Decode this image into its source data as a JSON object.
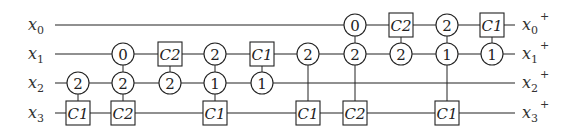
{
  "diagram": {
    "type": "reversible-circuit",
    "wires": [
      {
        "id": "x0",
        "input_label": "x",
        "input_sub": "0",
        "output_label": "x",
        "output_sub": "0",
        "output_sup": "+"
      },
      {
        "id": "x1",
        "input_label": "x",
        "input_sub": "1",
        "output_label": "x",
        "output_sub": "1",
        "output_sup": "+"
      },
      {
        "id": "x2",
        "input_label": "x",
        "input_sub": "2",
        "output_label": "x",
        "output_sub": "2",
        "output_sup": "+"
      },
      {
        "id": "x3",
        "input_label": "x",
        "input_sub": "3",
        "output_label": "x",
        "output_sub": "3",
        "output_sup": "+"
      }
    ],
    "columns": [
      {
        "gates": [
          {
            "wire": 2,
            "kind": "circle",
            "text": "2"
          },
          {
            "wire": 3,
            "kind": "box",
            "text": "C1"
          }
        ]
      },
      {
        "gates": [
          {
            "wire": 1,
            "kind": "circle",
            "text": "0"
          },
          {
            "wire": 2,
            "kind": "circle",
            "text": "2"
          },
          {
            "wire": 3,
            "kind": "box",
            "text": "C2"
          }
        ]
      },
      {
        "gates": [
          {
            "wire": 1,
            "kind": "box",
            "text": "C2"
          },
          {
            "wire": 2,
            "kind": "circle",
            "text": "2"
          }
        ]
      },
      {
        "gates": [
          {
            "wire": 1,
            "kind": "circle",
            "text": "2"
          },
          {
            "wire": 2,
            "kind": "circle",
            "text": "1"
          },
          {
            "wire": 3,
            "kind": "box",
            "text": "C1"
          }
        ]
      },
      {
        "gates": [
          {
            "wire": 1,
            "kind": "box",
            "text": "C1"
          },
          {
            "wire": 2,
            "kind": "circle",
            "text": "1"
          }
        ]
      },
      {
        "gates": [
          {
            "wire": 1,
            "kind": "circle",
            "text": "2"
          },
          {
            "wire": 3,
            "kind": "box",
            "text": "C1"
          }
        ]
      },
      {
        "gates": [
          {
            "wire": 0,
            "kind": "circle",
            "text": "0"
          },
          {
            "wire": 1,
            "kind": "circle",
            "text": "2"
          },
          {
            "wire": 3,
            "kind": "box",
            "text": "C2"
          }
        ]
      },
      {
        "gates": [
          {
            "wire": 0,
            "kind": "box",
            "text": "C2"
          },
          {
            "wire": 1,
            "kind": "circle",
            "text": "2"
          }
        ]
      },
      {
        "gates": [
          {
            "wire": 0,
            "kind": "circle",
            "text": "2"
          },
          {
            "wire": 1,
            "kind": "circle",
            "text": "1"
          },
          {
            "wire": 3,
            "kind": "box",
            "text": "C1"
          }
        ]
      },
      {
        "gates": [
          {
            "wire": 0,
            "kind": "box",
            "text": "C1"
          },
          {
            "wire": 1,
            "kind": "circle",
            "text": "1"
          }
        ]
      }
    ]
  },
  "layout": {
    "wire_y": [
      25,
      54,
      83,
      113
    ],
    "wire_x_start": 55,
    "wire_x_end": 515,
    "column_x": [
      78,
      123,
      170,
      215,
      262,
      308,
      355,
      401,
      447,
      492
    ],
    "circle_r": 11,
    "box_w": 24,
    "box_h": 24,
    "input_label_x": 28,
    "output_label_x": 522
  }
}
